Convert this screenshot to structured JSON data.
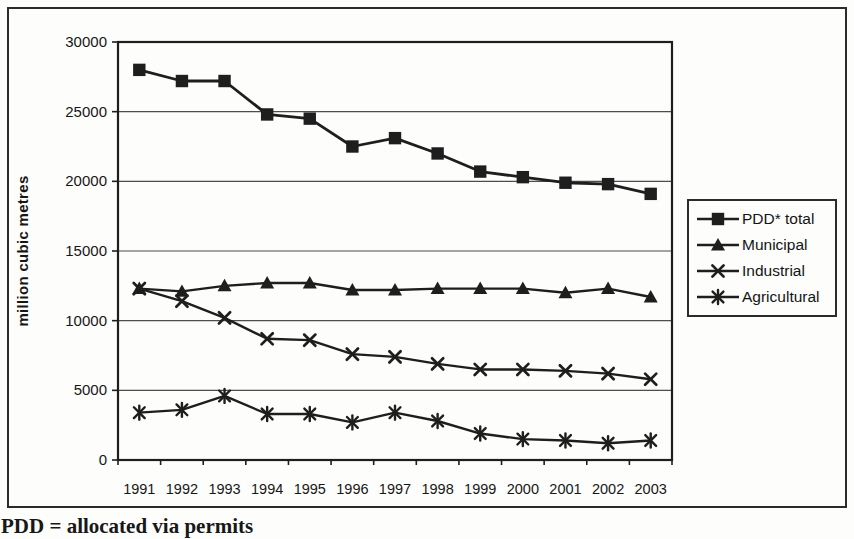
{
  "figure": {
    "ink_color": "#1e1e1e",
    "grid_color": "#4d4d4d",
    "background": "#fdfdfc",
    "footnote": "PDD = allocated via permits"
  },
  "chart_data": {
    "type": "line",
    "title": "",
    "xlabel": "",
    "ylabel": "million cubic metres",
    "ylim": [
      0,
      30000
    ],
    "ytick_interval": 5000,
    "ytick_labels": [
      "0",
      "5000",
      "10000",
      "15000",
      "20000",
      "25000",
      "30000"
    ],
    "grid": "horizontal",
    "legend_position": "right-outside",
    "categories": [
      "1991",
      "1992",
      "1993",
      "1994",
      "1995",
      "1996",
      "1997",
      "1998",
      "1999",
      "2000",
      "2001",
      "2002",
      "2003"
    ],
    "series": [
      {
        "name": "PDD* total",
        "marker": "square",
        "values": [
          28000,
          27200,
          27200,
          24800,
          24500,
          22500,
          23100,
          22000,
          20700,
          20300,
          19900,
          19800,
          19100
        ]
      },
      {
        "name": "Municipal",
        "marker": "triangle",
        "values": [
          12300,
          12100,
          12500,
          12700,
          12700,
          12200,
          12200,
          12300,
          12300,
          12300,
          12000,
          12300,
          11700
        ]
      },
      {
        "name": "Industrial",
        "marker": "x",
        "values": [
          12300,
          11400,
          10200,
          8700,
          8600,
          7600,
          7400,
          6900,
          6500,
          6500,
          6400,
          6200,
          5800
        ]
      },
      {
        "name": "Agricultural",
        "marker": "asterisk",
        "values": [
          3400,
          3600,
          4600,
          3300,
          3300,
          2700,
          3400,
          2800,
          1900,
          1500,
          1400,
          1200,
          1400
        ]
      }
    ]
  }
}
